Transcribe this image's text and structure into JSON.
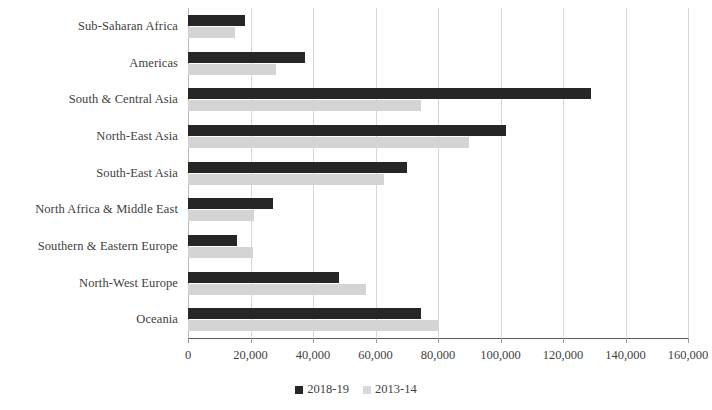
{
  "chart_data": {
    "type": "bar",
    "orientation": "horizontal",
    "title": "",
    "xlabel": "",
    "ylabel": "",
    "xlim": [
      0,
      160000
    ],
    "xticks": [
      0,
      20000,
      40000,
      60000,
      80000,
      100000,
      120000,
      140000,
      160000
    ],
    "xticklabels": [
      "0",
      "20,000",
      "40,000",
      "60,000",
      "80,000",
      "100,000",
      "120,000",
      "140,000",
      "160,000"
    ],
    "grid": true,
    "legend_position": "bottom",
    "categories": [
      "Sub-Saharan Africa",
      "Americas",
      "South & Central Asia",
      "North-East Asia",
      "South-East Asia",
      "North Africa & Middle East",
      "Southern & Eastern Europe",
      "North-West Europe",
      "Oceania"
    ],
    "series": [
      {
        "name": "2018-19",
        "color": "#262626",
        "values": [
          18100,
          37400,
          129000,
          101700,
          70100,
          27200,
          15600,
          48400,
          74400
        ]
      },
      {
        "name": "2013-14",
        "color": "#d4d4d4",
        "values": [
          15000,
          28200,
          74700,
          90000,
          62800,
          21100,
          20800,
          57000,
          80000
        ]
      }
    ]
  },
  "legend": {
    "items": [
      {
        "label": "2018-19"
      },
      {
        "label": "2013-14"
      }
    ]
  },
  "colors": {
    "series_a": "#262626",
    "series_b": "#d4d4d4",
    "gridline": "#d8d8d8",
    "axis": "#5a5a5a",
    "text": "#3f3f3f"
  }
}
